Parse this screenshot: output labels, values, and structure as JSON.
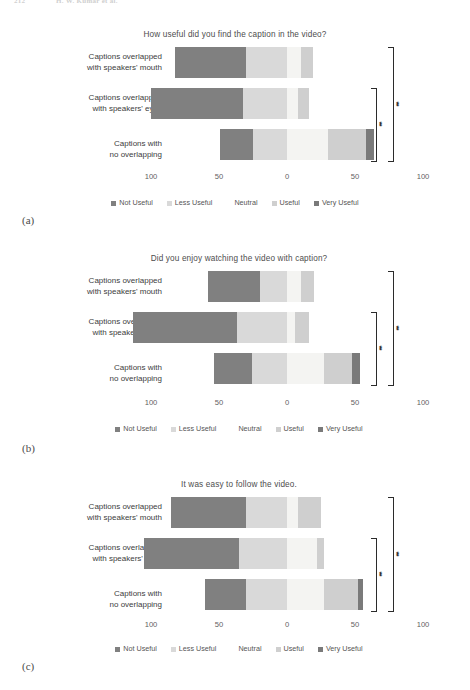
{
  "page_header": {
    "folio": "212",
    "running_head": "H. W. Kumar et al."
  },
  "colors": {
    "not_useful": "#808080",
    "less_useful": "#d9d9d9",
    "neutral": "#f7f7f5",
    "useful": "#cfcfcf",
    "very_useful": "#7a7a7a",
    "text": "#3d3d3d",
    "bracket": "#2b2b2b"
  },
  "legend": {
    "items": [
      {
        "label": "Not Useful",
        "color": "#808080"
      },
      {
        "label": "Less Useful",
        "color": "#d9d9d9"
      },
      {
        "label": "Neutral",
        "color": "#f4f4f2"
      },
      {
        "label": "Useful",
        "color": "#cfcfcf"
      },
      {
        "label": "Very Useful",
        "color": "#7a7a7a"
      }
    ]
  },
  "axis": {
    "ticks": [
      "100",
      "50",
      "0",
      "50",
      "100"
    ],
    "positions_px": [
      151,
      219,
      287,
      355,
      423
    ]
  },
  "categories": [
    {
      "line1": "Captions overlapped",
      "line2": "with speakers'  mouth"
    },
    {
      "line1": "Captions overlapped",
      "line2": "with speakers'  eyes"
    },
    {
      "line1": "Captions with",
      "line2": "no overlapping"
    }
  ],
  "significance": {
    "marker": "**"
  },
  "figures": [
    {
      "tag": "(a)",
      "title": "How useful did you find the caption in the video?"
    },
    {
      "tag": "(b)",
      "title": "Did you enjoy watching the video with caption?"
    },
    {
      "tag": "(c)",
      "title": "It was easy to follow the video."
    }
  ],
  "chart_data": [
    {
      "type": "bar",
      "subtype": "diverging-stacked-bar",
      "title": "How useful did you find the caption in the video?",
      "xlabel": "",
      "ylabel": "",
      "xlim": [
        -100,
        100
      ],
      "xticks": [
        -100,
        -50,
        0,
        50,
        100
      ],
      "xticklabels": [
        "100",
        "50",
        "0",
        "50",
        "100"
      ],
      "grid": false,
      "legend_position": "bottom",
      "categories": [
        "Captions overlapped with speakers' mouth",
        "Captions overlapped with speakers' eyes",
        "Captions with no overlapping"
      ],
      "series": [
        {
          "name": "Not Useful",
          "values": [
            52,
            68,
            24
          ]
        },
        {
          "name": "Less Useful",
          "values": [
            30,
            32,
            25
          ]
        },
        {
          "name": "Neutral",
          "values": [
            10,
            8,
            30
          ]
        },
        {
          "name": "Useful",
          "values": [
            9,
            8,
            28
          ]
        },
        {
          "name": "Very Useful",
          "values": [
            0,
            0,
            6
          ]
        }
      ],
      "annotations": [
        {
          "type": "significance-bracket",
          "label": "**",
          "between": [
            1,
            2
          ]
        },
        {
          "type": "significance-bracket",
          "label": "**",
          "between": [
            0,
            2
          ]
        }
      ]
    },
    {
      "type": "bar",
      "subtype": "diverging-stacked-bar",
      "title": "Did you enjoy watching the video with caption?",
      "xlabel": "",
      "ylabel": "",
      "xlim": [
        -100,
        100
      ],
      "xticks": [
        -100,
        -50,
        0,
        50,
        100
      ],
      "xticklabels": [
        "100",
        "50",
        "0",
        "50",
        "100"
      ],
      "grid": false,
      "legend_position": "bottom",
      "categories": [
        "Captions overlapped with speakers' mouth",
        "Captions overlapped with speakers' eyes",
        "Captions with no overlapping"
      ],
      "series": [
        {
          "name": "Not Useful",
          "values": [
            38,
            76,
            28
          ]
        },
        {
          "name": "Less Useful",
          "values": [
            20,
            37,
            26
          ]
        },
        {
          "name": "Neutral",
          "values": [
            10,
            6,
            27
          ]
        },
        {
          "name": "Useful",
          "values": [
            10,
            10,
            21
          ]
        },
        {
          "name": "Very Useful",
          "values": [
            0,
            0,
            6
          ]
        }
      ],
      "annotations": [
        {
          "type": "significance-bracket",
          "label": "**",
          "between": [
            1,
            2
          ]
        },
        {
          "type": "significance-bracket",
          "label": "**",
          "between": [
            0,
            2
          ]
        }
      ]
    },
    {
      "type": "bar",
      "subtype": "diverging-stacked-bar",
      "title": "It was easy to follow the video.",
      "xlabel": "",
      "ylabel": "",
      "xlim": [
        -100,
        100
      ],
      "xticks": [
        -100,
        -50,
        0,
        50,
        100
      ],
      "xticklabels": [
        "100",
        "50",
        "0",
        "50",
        "100"
      ],
      "grid": false,
      "legend_position": "bottom",
      "categories": [
        "Captions overlapped with speakers' mouth",
        "Captions overlapped with speakers' eyes",
        "Captions with no overlapping"
      ],
      "series": [
        {
          "name": "Not Useful",
          "values": [
            55,
            70,
            30
          ]
        },
        {
          "name": "Less Useful",
          "values": [
            30,
            35,
            30
          ]
        },
        {
          "name": "Neutral",
          "values": [
            8,
            22,
            27
          ]
        },
        {
          "name": "Useful",
          "values": [
            17,
            5,
            25
          ]
        },
        {
          "name": "Very Useful",
          "values": [
            0,
            0,
            4
          ]
        }
      ],
      "annotations": [
        {
          "type": "significance-bracket",
          "label": "**",
          "between": [
            1,
            2
          ]
        },
        {
          "type": "significance-bracket",
          "label": "**",
          "between": [
            0,
            2
          ]
        }
      ]
    }
  ]
}
